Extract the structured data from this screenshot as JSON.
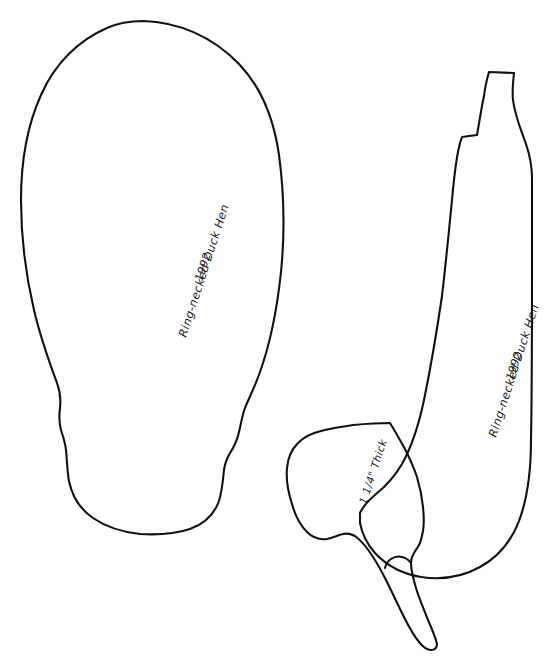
{
  "document": {
    "kind": "hand-drawn carving pattern sheet",
    "subject": "Ring-necked Duck Hen",
    "year": "1992",
    "background_color": "#ffffff",
    "ink_color": "#111111"
  },
  "annotations": {
    "top_view_title": "Ring-necked Duck Hen",
    "top_view_year": "1992",
    "side_view_title": "Ring-necked Duck Hen",
    "side_view_year": "1992",
    "thickness_note": "1 1/4\" Thick"
  },
  "shapes": [
    {
      "name": "top-view-body-outline",
      "description": "large rounded body pattern, top view, with tail notch at lower end"
    },
    {
      "name": "side-view-body-outline",
      "description": "side profile body pattern with raised head and bill at top"
    },
    {
      "name": "head-wing-piece-outline",
      "description": "smaller overlapping head and wing block piece"
    }
  ]
}
